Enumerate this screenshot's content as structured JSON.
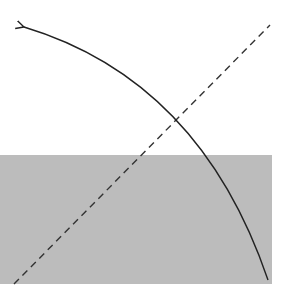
{
  "diagram": {
    "background_color": "#ffffff",
    "shaded_region": {
      "x": 0,
      "y": 155,
      "width": 272,
      "height": 129,
      "color": "#bcbcbc"
    },
    "dashed_line": {
      "x1": 14,
      "y1": 284,
      "x2": 270,
      "y2": 25,
      "color": "#333333",
      "dash": "7 5"
    },
    "curved_arrow": {
      "path": "M 268 280 Q 200 80 24 27",
      "color": "#222222",
      "arrowhead_at": "start-top-left"
    }
  }
}
